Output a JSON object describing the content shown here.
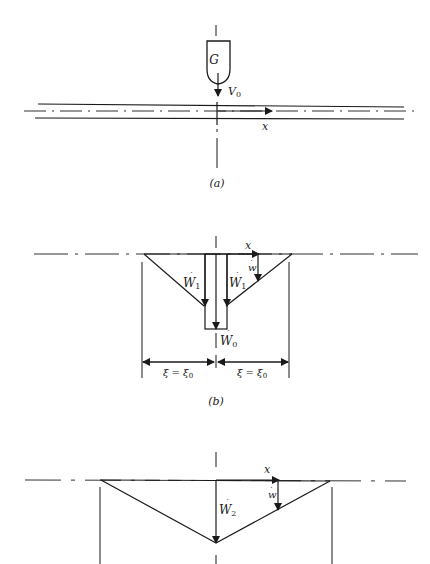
{
  "figure_a": {
    "caption": "(a)",
    "body_label": "G",
    "velocity_label": "V",
    "velocity_sub": "0",
    "axis_label": "x"
  },
  "figure_b": {
    "caption": "(b)",
    "left_rate_label": "W",
    "left_rate_sub": "1",
    "right_rate_label": "W",
    "right_rate_sub": "1",
    "center_rate_label": "W",
    "center_rate_sub": "0",
    "local_rate_label": "w",
    "axis_label": "x",
    "left_dim_label": "ξ = ξ",
    "left_dim_sub": "0",
    "right_dim_label": "ξ = ξ",
    "right_dim_sub": "0"
  },
  "figure_c": {
    "center_rate_label": "W",
    "center_rate_sub": "2",
    "local_rate_label": "w",
    "axis_label": "x"
  },
  "colors": {
    "ink": "#1a1a1a",
    "background": "#ffffff"
  }
}
